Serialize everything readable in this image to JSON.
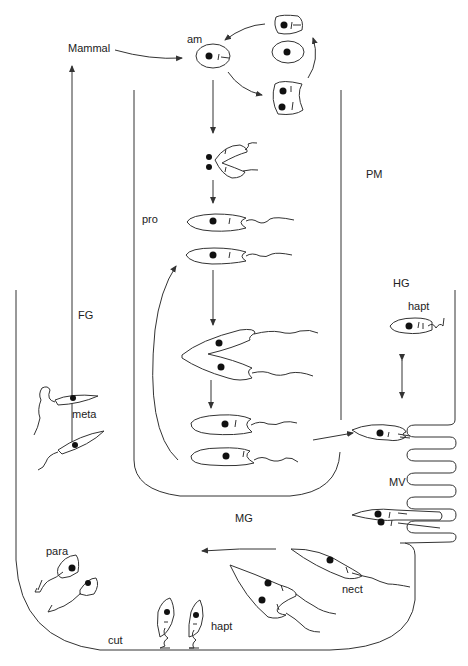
{
  "diagram": {
    "type": "life-cycle",
    "labels": {
      "mammal": "Mammal",
      "am": "am",
      "pm": "PM",
      "pro": "pro",
      "fg": "FG",
      "hg": "HG",
      "hapt_top": "hapt",
      "meta": "meta",
      "mv": "MV",
      "mg": "MG",
      "para": "para",
      "nect": "nect",
      "cut": "cut",
      "hapt_bottom": "hapt"
    },
    "stages": [
      {
        "id": "am",
        "name": "amastigote",
        "location": "Mammal"
      },
      {
        "id": "pro",
        "name": "procyclic promastigote",
        "location": "inside PM"
      },
      {
        "id": "nect",
        "name": "nectomonad",
        "location": "MG"
      },
      {
        "id": "hapt",
        "name": "haptomonad",
        "location": "HG / cut"
      },
      {
        "id": "para",
        "name": "paramastigote",
        "location": "cut"
      },
      {
        "id": "meta",
        "name": "metacyclic",
        "location": "FG"
      }
    ],
    "colors": {
      "stroke": "#333333",
      "nucleus": "#111111",
      "background": "#ffffff"
    }
  }
}
